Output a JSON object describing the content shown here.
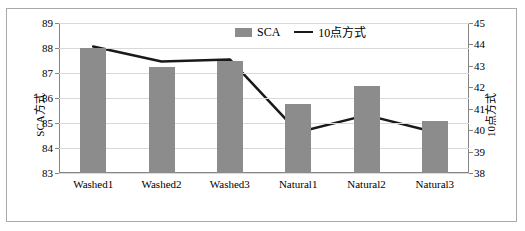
{
  "chart_data": {
    "type": "bar",
    "title": "",
    "categories": [
      "Washed1",
      "Washed2",
      "Washed3",
      "Natural1",
      "Natural2",
      "Natural3"
    ],
    "series": [
      {
        "name": "SCA",
        "type": "bar",
        "axis": "left",
        "values": [
          88.0,
          87.25,
          87.5,
          85.75,
          86.5,
          85.1
        ],
        "color": "#8c8c8c"
      },
      {
        "name": "10点方式",
        "type": "line",
        "axis": "right",
        "values": [
          43.9,
          43.2,
          43.3,
          39.9,
          40.7,
          39.9
        ],
        "color": "#19191c"
      }
    ],
    "ylabel": "SCA方式",
    "y2label": "10点方式",
    "xlabel": "",
    "ylim": [
      83,
      89
    ],
    "y2lim": [
      38,
      45
    ],
    "yticks": [
      "89",
      "88",
      "87",
      "86",
      "85",
      "84",
      "83"
    ],
    "y2ticks": [
      "45",
      "44",
      "43",
      "42",
      "41",
      "40",
      "39",
      "38"
    ],
    "grid": true,
    "legend_position": "top-center"
  },
  "legend": {
    "bar_label": "SCA",
    "line_label": "10点方式"
  },
  "axes": {
    "left_title": "SCA方式",
    "right_title": "10点方式"
  }
}
